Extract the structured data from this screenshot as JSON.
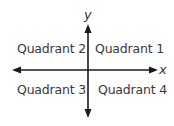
{
  "diagram": {
    "axes": {
      "x_label": "x",
      "y_label": "y",
      "color": "#1a1a1a"
    },
    "quadrants": [
      {
        "id": 1,
        "label": "Quadrant 1",
        "position": "top-right"
      },
      {
        "id": 2,
        "label": "Quadrant 2",
        "position": "top-left"
      },
      {
        "id": 3,
        "label": "Quadrant 3",
        "position": "bottom-left"
      },
      {
        "id": 4,
        "label": "Quadrant 4",
        "position": "bottom-right"
      }
    ]
  }
}
